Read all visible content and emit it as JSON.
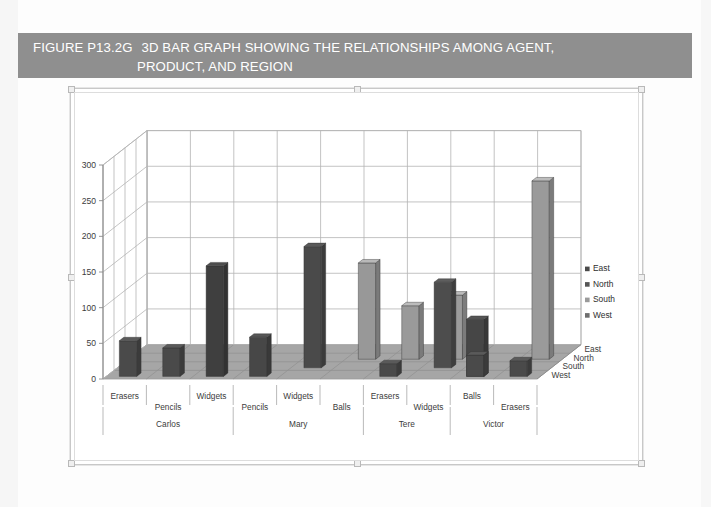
{
  "figure": {
    "number": "FIGURE P13.2G",
    "caption_line1": "3D BAR GRAPH SHOWING THE RELATIONSHIPS AMONG AGENT,",
    "caption_line2": "PRODUCT, AND REGION",
    "banner_color": "#8f8f8f"
  },
  "chart_data": {
    "type": "bar",
    "title": "",
    "subtitle": "",
    "xlabel": "",
    "ylabel": "",
    "zlabel": "",
    "ylim": [
      0,
      300
    ],
    "yticks": [
      0,
      50,
      100,
      150,
      200,
      250,
      300
    ],
    "grid": true,
    "legend_position": "right",
    "projection": "3d",
    "depth_axis": {
      "name": "Region",
      "categories": [
        "East",
        "North",
        "South",
        "West"
      ]
    },
    "category_axis": {
      "name": "Agent / Product",
      "groups": [
        {
          "agent": "Carlos",
          "products": [
            "Erasers",
            "Pencils",
            "Widgets"
          ]
        },
        {
          "agent": "Mary",
          "products": [
            "Pencils",
            "Widgets",
            "Balls"
          ]
        },
        {
          "agent": "Tere",
          "products": [
            "Erasers",
            "Widgets"
          ]
        },
        {
          "agent": "Victor",
          "products": [
            "Balls",
            "Erasers"
          ]
        }
      ],
      "flat_categories": [
        "Erasers",
        "Pencils",
        "Widgets",
        "Pencils",
        "Widgets",
        "Balls",
        "Erasers",
        "Widgets",
        "Balls",
        "Erasers"
      ]
    },
    "legend": [
      {
        "label": "East",
        "color": "#4a4a4a"
      },
      {
        "label": "North",
        "color": "#555555"
      },
      {
        "label": "South",
        "color": "#9a9a9a"
      },
      {
        "label": "West",
        "color": "#6e6e6e"
      }
    ],
    "series": [
      {
        "name": "East",
        "values": [
          50,
          40,
          155,
          55,
          0,
          135,
          0,
          0,
          80,
          20
        ]
      },
      {
        "name": "North",
        "values": [
          0,
          0,
          0,
          0,
          170,
          0,
          0,
          120,
          0,
          0
        ]
      },
      {
        "name": "South",
        "values": [
          0,
          0,
          0,
          0,
          0,
          0,
          75,
          0,
          90,
          250
        ]
      },
      {
        "name": "West",
        "values": [
          0,
          0,
          0,
          0,
          0,
          0,
          0,
          0,
          0,
          0
        ]
      }
    ],
    "bars": [
      {
        "agent": "Carlos",
        "product": "Erasers",
        "region": "East",
        "value": 50,
        "col": 0,
        "row": 0,
        "color": "#4a4a4a"
      },
      {
        "agent": "Carlos",
        "product": "Pencils",
        "region": "East",
        "value": 40,
        "col": 1,
        "row": 0,
        "color": "#4a4a4a"
      },
      {
        "agent": "Carlos",
        "product": "Widgets",
        "region": "East",
        "value": 155,
        "col": 2,
        "row": 0,
        "color": "#3f3f3f"
      },
      {
        "agent": "Mary",
        "product": "Pencils",
        "region": "East",
        "value": 55,
        "col": 3,
        "row": 0,
        "color": "#474747"
      },
      {
        "agent": "Mary",
        "product": "Widgets",
        "region": "North",
        "value": 170,
        "col": 4,
        "row": 1,
        "color": "#4a4a4a"
      },
      {
        "agent": "Mary",
        "product": "Balls",
        "region": "South",
        "value": 135,
        "col": 5,
        "row": 2,
        "color": "#989898"
      },
      {
        "agent": "Tere",
        "product": "Erasers",
        "region": "South",
        "value": 75,
        "col": 6,
        "row": 2,
        "color": "#9a9a9a"
      },
      {
        "agent": "Tere",
        "product": "Erasers",
        "region": "East",
        "value": 18,
        "col": 6,
        "row": 0,
        "color": "#4a4a4a"
      },
      {
        "agent": "Tere",
        "product": "Widgets",
        "region": "North",
        "value": 120,
        "col": 7,
        "row": 1,
        "color": "#4d4d4d"
      },
      {
        "agent": "Tere",
        "product": "Widgets",
        "region": "South",
        "value": 90,
        "col": 7,
        "row": 2,
        "color": "#9b9b9b"
      },
      {
        "agent": "Victor",
        "product": "Balls",
        "region": "East",
        "value": 80,
        "col": 8,
        "row": 0,
        "color": "#464646"
      },
      {
        "agent": "Victor",
        "product": "Balls",
        "region": "South",
        "value": 250,
        "col": 9,
        "row": 2,
        "color": "#9a9a9a"
      },
      {
        "agent": "Victor",
        "product": "Erasers",
        "region": "East",
        "value": 22,
        "col": 9,
        "row": 0,
        "color": "#4a4a4a"
      },
      {
        "agent": "Victor",
        "product": "Erasers",
        "region": "East",
        "value": 30,
        "col": 8,
        "row": 0,
        "color": "#4a4a4a"
      }
    ]
  }
}
